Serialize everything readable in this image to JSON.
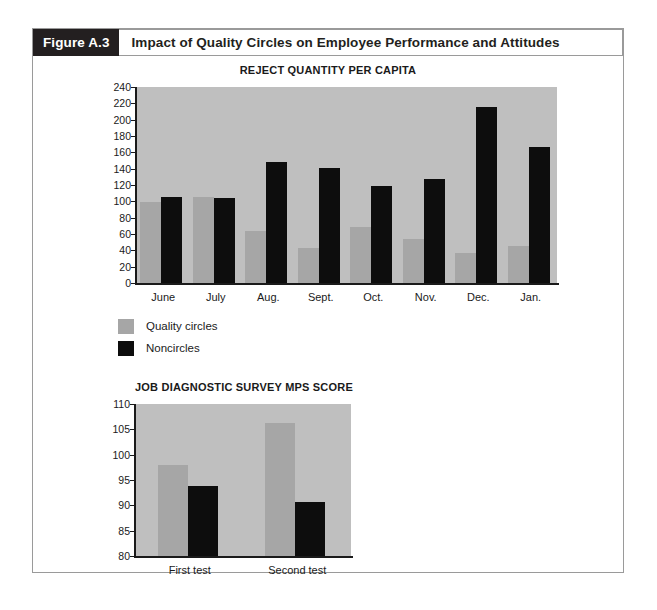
{
  "figure": {
    "number_label": "Figure A.3",
    "title": "Impact of Quality Circles on Employee Performance and Attitudes"
  },
  "legend": {
    "items": [
      {
        "label": "Quality circles",
        "color": "#a6a6a6"
      },
      {
        "label": "Noncircles",
        "color": "#0d0d0d"
      }
    ]
  },
  "colors": {
    "plot_background": "#bfbfbf",
    "quality_circles": "#a6a6a6",
    "noncircles": "#0d0d0d",
    "figure_number_background": "#231f20",
    "frame_border": "#9a9a9a"
  },
  "chart_data": [
    {
      "type": "bar",
      "title": "REJECT QUANTITY PER CAPITA",
      "xlabel": "",
      "ylabel": "",
      "ylim": [
        0,
        240
      ],
      "ytick_step": 20,
      "yticks": [
        240,
        220,
        200,
        180,
        160,
        140,
        120,
        100,
        80,
        60,
        40,
        20,
        0
      ],
      "categories": [
        "June",
        "July",
        "Aug.",
        "Sept.",
        "Oct.",
        "Nov.",
        "Dec.",
        "Jan."
      ],
      "series": [
        {
          "name": "Quality circles",
          "color": "#a6a6a6",
          "values": [
            99,
            105,
            64,
            43,
            68,
            54,
            37,
            45
          ]
        },
        {
          "name": "Noncircles",
          "color": "#0d0d0d",
          "values": [
            105,
            104,
            148,
            141,
            119,
            127,
            216,
            167
          ]
        }
      ],
      "grid": false,
      "legend_position": "below"
    },
    {
      "type": "bar",
      "title": "JOB DIAGNOSTIC SURVEY MPS SCORE",
      "xlabel": "",
      "ylabel": "",
      "ylim": [
        80,
        110
      ],
      "ytick_step": 5,
      "yticks": [
        110,
        105,
        100,
        95,
        90,
        85,
        80
      ],
      "categories": [
        "First test",
        "Second test"
      ],
      "series": [
        {
          "name": "Quality circles",
          "color": "#a6a6a6",
          "values": [
            98.0,
            106.3
          ]
        },
        {
          "name": "Noncircles",
          "color": "#0d0d0d",
          "values": [
            93.8,
            90.7
          ]
        }
      ],
      "grid": false,
      "legend_position": "none"
    }
  ]
}
